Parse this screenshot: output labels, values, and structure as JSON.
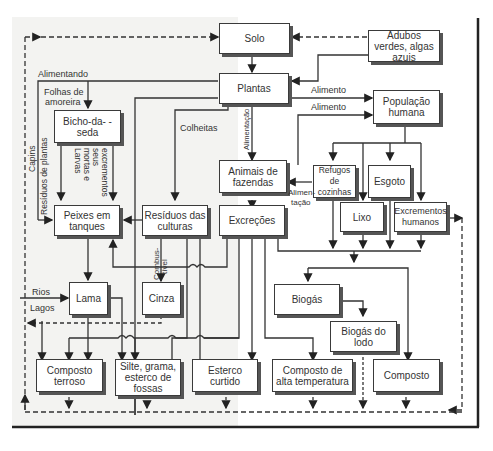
{
  "diagram": {
    "nodes": {
      "solo": "Solo",
      "adubos": "Adubos verdes, algas azuis",
      "plantas": "Plantas",
      "populacao": "População humana",
      "bicho": "Bicho-da- -seda",
      "animais": "Animais de fazendas",
      "refugos": "Refugos de cozinhas",
      "esgoto": "Esgoto",
      "lixo": "Lixo",
      "excrementos": "Excrementos humanos",
      "peixes": "Peixes em tanques",
      "residuos": "Resíduos das culturas",
      "excrecoes": "Excreções",
      "lama": "Lama",
      "cinza": "Cinza",
      "biogas": "Biogás",
      "biogas_lodo": "Biogás do lodo",
      "composto_terroso": "Composto terroso",
      "silte": "Silte, grama, esterco de fossas",
      "esterco": "Esterco curtido",
      "composto_alta": "Composto de alta temperatura",
      "composto": "Composto"
    },
    "labels": {
      "alimentando": "Alimentando",
      "folhas1": "Folhas de",
      "folhas2": "amoreira",
      "colheitas": "Colheitas",
      "alimento1": "Alimento",
      "alimento2": "Alimento",
      "alimentacao_v": "Alimentação",
      "alimen": "Alimen-",
      "tacao": "tação",
      "capins": "Capins",
      "residuos_plantas": "Resíduos de plantas",
      "larvas1": "Larvas",
      "larvas2": "mortas e",
      "larvas3": "seus",
      "larvas4": "excrementos",
      "combus1": "Combus-",
      "combus2": "tível",
      "rios": "Rios",
      "lagos": "Lagos"
    }
  }
}
